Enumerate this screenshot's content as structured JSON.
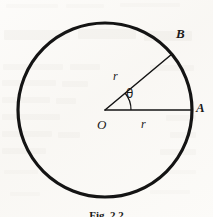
{
  "figure": {
    "caption": "Fig. 2.2",
    "shape": "circle",
    "stroke_color": "#141414",
    "background_color": "#fbfaf8",
    "circle": {
      "center_x": 105,
      "center_y": 110,
      "radius": 87,
      "stroke_width": 3.2
    },
    "center_label": "O",
    "angle_label": "θ",
    "radius_label_horizontal": "r",
    "radius_label_diagonal": "r",
    "points": [
      {
        "name": "A",
        "label": "A",
        "angle_degrees": 0,
        "x": 192,
        "y": 110
      },
      {
        "name": "B",
        "label": "B",
        "angle_degrees": 40,
        "x": 172,
        "y": 54
      }
    ],
    "radii": [
      {
        "from": "O",
        "to": "A",
        "label": "r",
        "orientation": "horizontal"
      },
      {
        "from": "O",
        "to": "B",
        "label": "r",
        "orientation": "diagonal"
      }
    ],
    "arc": {
      "label": "θ",
      "start_angle_degrees": 0,
      "end_angle_degrees": 40,
      "radius": 26
    }
  },
  "background": {
    "description": "faint ghost text from reverse side of scanned page",
    "ghost_color": "#d9d6cf"
  }
}
